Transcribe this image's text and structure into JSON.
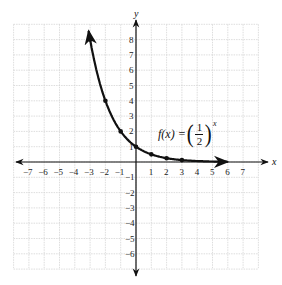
{
  "chart_data": {
    "type": "line",
    "title": "",
    "function_label": "f(x) = (1/2)^x",
    "equation": {
      "lhs": "f(x) =",
      "numerator": "1",
      "denominator": "2",
      "exponent": "x"
    },
    "xlabel": "x",
    "ylabel": "y",
    "xlim": [
      -8,
      8
    ],
    "ylim": [
      -7,
      9
    ],
    "grid": true,
    "x_ticks": [
      "-7",
      "-6",
      "-5",
      "-4",
      "-3",
      "-2",
      "-1",
      "1",
      "2",
      "3",
      "4",
      "5",
      "6",
      "7"
    ],
    "y_ticks_pos": [
      "1",
      "2",
      "3",
      "4",
      "5",
      "6",
      "7",
      "8"
    ],
    "y_ticks_neg": [
      "-1",
      "-2",
      "-3",
      "-4",
      "-5",
      "-6"
    ],
    "series": [
      {
        "name": "f(x) = (1/2)^x",
        "points": [
          {
            "x": -3,
            "y": 8
          },
          {
            "x": -2,
            "y": 4
          },
          {
            "x": -1,
            "y": 2
          },
          {
            "x": 0,
            "y": 1
          },
          {
            "x": 1,
            "y": 0.5
          },
          {
            "x": 2,
            "y": 0.25
          },
          {
            "x": 3,
            "y": 0.125
          }
        ],
        "domain": [
          -3.1,
          6
        ]
      }
    ]
  }
}
